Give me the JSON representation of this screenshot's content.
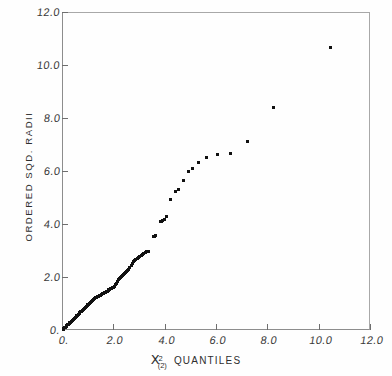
{
  "chart_data": {
    "type": "scatter",
    "title": "",
    "xlabel": "χ²(2) QUANTILES",
    "ylabel": "ORDERED SQD. RADII",
    "xlim": [
      0,
      12
    ],
    "ylim": [
      0,
      12
    ],
    "grid": false,
    "legend": null,
    "marker": "filled-square",
    "marker_color": "#111111",
    "frame_color": "#8d8d8d",
    "background_color": "#ffffff",
    "x_ticks": [
      0,
      2,
      4,
      6,
      8,
      10,
      12
    ],
    "y_ticks": [
      0,
      2,
      4,
      6,
      8,
      10,
      12
    ],
    "x_tick_labels": [
      "0.",
      "2.0",
      "4.0",
      "6.0",
      "8.0",
      "10.0",
      "12.0"
    ],
    "y_tick_labels": [
      "0.",
      "2.0",
      "4.0",
      "6.0",
      "8.0",
      "10.0",
      "12.0"
    ],
    "points": [
      [
        0.04,
        0.03
      ],
      [
        0.07,
        0.05
      ],
      [
        0.1,
        0.08
      ],
      [
        0.13,
        0.1
      ],
      [
        0.16,
        0.13
      ],
      [
        0.19,
        0.16
      ],
      [
        0.22,
        0.19
      ],
      [
        0.25,
        0.21
      ],
      [
        0.28,
        0.24
      ],
      [
        0.31,
        0.27
      ],
      [
        0.34,
        0.3
      ],
      [
        0.37,
        0.33
      ],
      [
        0.4,
        0.36
      ],
      [
        0.43,
        0.39
      ],
      [
        0.46,
        0.41
      ],
      [
        0.49,
        0.44
      ],
      [
        0.52,
        0.47
      ],
      [
        0.55,
        0.5
      ],
      [
        0.58,
        0.53
      ],
      [
        0.61,
        0.56
      ],
      [
        0.64,
        0.59
      ],
      [
        0.67,
        0.62
      ],
      [
        0.7,
        0.65
      ],
      [
        0.74,
        0.68
      ],
      [
        0.77,
        0.71
      ],
      [
        0.8,
        0.74
      ],
      [
        0.83,
        0.77
      ],
      [
        0.86,
        0.8
      ],
      [
        0.89,
        0.83
      ],
      [
        0.92,
        0.86
      ],
      [
        0.95,
        0.89
      ],
      [
        0.98,
        0.92
      ],
      [
        1.01,
        0.95
      ],
      [
        1.04,
        0.98
      ],
      [
        1.07,
        1.01
      ],
      [
        1.1,
        1.04
      ],
      [
        1.13,
        1.06
      ],
      [
        1.16,
        1.09
      ],
      [
        1.19,
        1.12
      ],
      [
        1.22,
        1.15
      ],
      [
        1.25,
        1.17
      ],
      [
        1.28,
        1.19
      ],
      [
        1.31,
        1.21
      ],
      [
        1.34,
        1.23
      ],
      [
        1.37,
        1.25
      ],
      [
        1.4,
        1.26
      ],
      [
        1.44,
        1.28
      ],
      [
        1.47,
        1.3
      ],
      [
        1.5,
        1.32
      ],
      [
        1.53,
        1.34
      ],
      [
        1.56,
        1.36
      ],
      [
        1.6,
        1.38
      ],
      [
        1.63,
        1.39
      ],
      [
        1.66,
        1.41
      ],
      [
        1.7,
        1.43
      ],
      [
        1.73,
        1.45
      ],
      [
        1.76,
        1.47
      ],
      [
        1.8,
        1.49
      ],
      [
        1.83,
        1.51
      ],
      [
        1.87,
        1.53
      ],
      [
        1.9,
        1.55
      ],
      [
        1.94,
        1.57
      ],
      [
        1.97,
        1.59
      ],
      [
        2.01,
        1.62
      ],
      [
        2.04,
        1.66
      ],
      [
        2.08,
        1.71
      ],
      [
        2.12,
        1.77
      ],
      [
        2.15,
        1.82
      ],
      [
        2.19,
        1.9
      ],
      [
        2.23,
        1.95
      ],
      [
        2.27,
        1.99
      ],
      [
        2.31,
        2.02
      ],
      [
        2.35,
        2.07
      ],
      [
        2.39,
        2.1
      ],
      [
        2.43,
        2.13
      ],
      [
        2.47,
        2.17
      ],
      [
        2.51,
        2.21
      ],
      [
        2.56,
        2.26
      ],
      [
        2.6,
        2.3
      ],
      [
        2.64,
        2.36
      ],
      [
        2.69,
        2.42
      ],
      [
        2.73,
        2.52
      ],
      [
        2.78,
        2.58
      ],
      [
        2.83,
        2.62
      ],
      [
        2.88,
        2.65
      ],
      [
        2.93,
        2.68
      ],
      [
        2.98,
        2.72
      ],
      [
        3.03,
        2.77
      ],
      [
        3.08,
        2.81
      ],
      [
        3.14,
        2.85
      ],
      [
        3.19,
        2.88
      ],
      [
        3.25,
        2.91
      ],
      [
        3.31,
        2.95
      ],
      [
        3.37,
        2.98
      ],
      [
        3.56,
        3.52
      ],
      [
        3.6,
        3.54
      ],
      [
        3.64,
        3.56
      ],
      [
        3.84,
        4.1
      ],
      [
        3.88,
        4.11
      ],
      [
        3.93,
        4.13
      ],
      [
        3.98,
        4.18
      ],
      [
        4.07,
        4.3
      ],
      [
        4.22,
        4.93
      ],
      [
        4.42,
        5.22
      ],
      [
        4.54,
        5.3
      ],
      [
        4.72,
        5.66
      ],
      [
        4.93,
        6.0
      ],
      [
        5.07,
        6.11
      ],
      [
        5.33,
        6.33
      ],
      [
        5.62,
        6.5
      ],
      [
        6.05,
        6.63
      ],
      [
        6.57,
        6.66
      ],
      [
        7.24,
        7.13
      ],
      [
        8.25,
        8.4
      ],
      [
        10.45,
        10.65
      ]
    ]
  },
  "axes": {
    "y_title": "ORDERED SQD. RADII",
    "x_title": {
      "chi": "X",
      "superscript": "2",
      "subscript": "(2)",
      "suffix": "QUANTILES"
    }
  }
}
